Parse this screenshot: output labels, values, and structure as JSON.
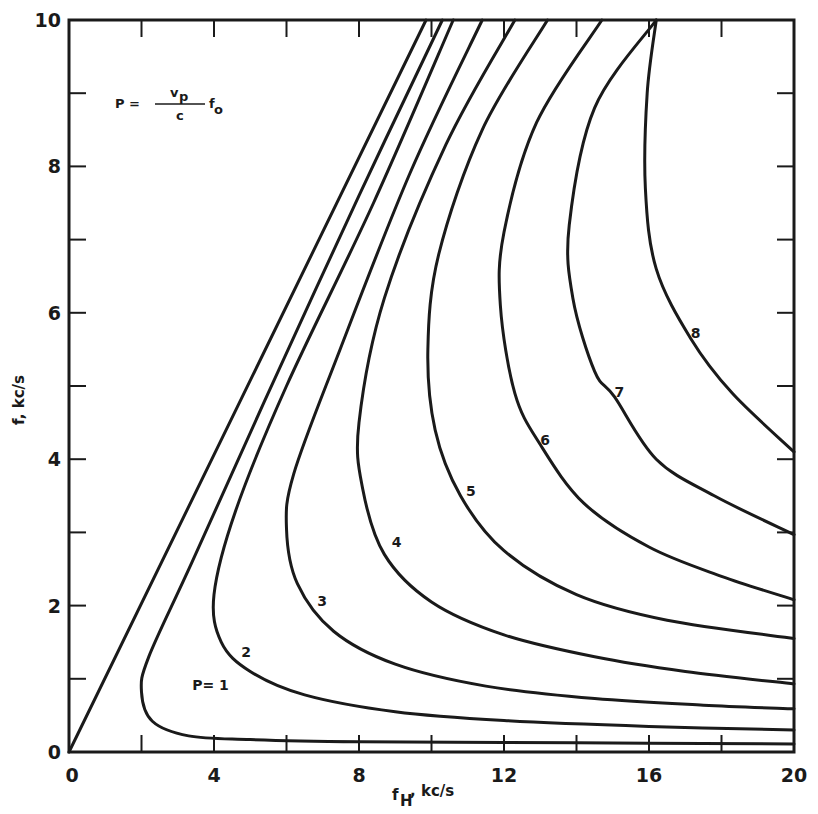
{
  "chart_data": {
    "type": "line",
    "title": "",
    "xlabel": "f_H, kc/s",
    "ylabel": "f, kc/s",
    "xlim": [
      0,
      20
    ],
    "ylim": [
      0,
      10
    ],
    "x_ticks_major": [
      0,
      4,
      8,
      12,
      16,
      20
    ],
    "x_ticks_minor_step": 2,
    "y_ticks_major": [
      0,
      2,
      4,
      6,
      8,
      10
    ],
    "y_ticks_minor_step": 1,
    "grid": false,
    "legend": null,
    "annotations": [
      {
        "text": "P = (v_p / c) f_o",
        "x": 2.3,
        "y": 9.0,
        "kind": "formula"
      },
      {
        "text": "P= 1",
        "x": 3.4,
        "y": 0.85
      },
      {
        "text": "2",
        "x": 4.75,
        "y": 1.3
      },
      {
        "text": "3",
        "x": 6.85,
        "y": 2.0
      },
      {
        "text": "4",
        "x": 8.9,
        "y": 2.8
      },
      {
        "text": "5",
        "x": 10.95,
        "y": 3.5
      },
      {
        "text": "6",
        "x": 13.0,
        "y": 4.2
      },
      {
        "text": "7",
        "x": 15.05,
        "y": 4.85
      },
      {
        "text": "8",
        "x": 17.15,
        "y": 5.65
      }
    ],
    "series": [
      {
        "name": "boundary f = f_H",
        "kind": "straight-line",
        "points": [
          [
            0,
            0
          ],
          [
            9.85,
            10
          ]
        ]
      },
      {
        "name": "P=1",
        "points": [
          [
            10.3,
            10
          ],
          [
            8.0,
            7.6
          ],
          [
            5.4,
            4.8
          ],
          [
            3.4,
            2.6
          ],
          [
            2.2,
            1.3
          ],
          [
            2.0,
            0.82
          ],
          [
            2.3,
            0.42
          ],
          [
            3.3,
            0.22
          ],
          [
            5.0,
            0.17
          ],
          [
            8.0,
            0.14
          ],
          [
            12.0,
            0.13
          ],
          [
            16.0,
            0.12
          ],
          [
            20.0,
            0.11
          ]
        ]
      },
      {
        "name": "P=2",
        "points": [
          [
            10.6,
            10
          ],
          [
            8.4,
            7.5
          ],
          [
            6.0,
            5.0
          ],
          [
            4.6,
            3.3
          ],
          [
            4.0,
            2.15
          ],
          [
            4.2,
            1.5
          ],
          [
            5.0,
            1.1
          ],
          [
            6.5,
            0.78
          ],
          [
            9.0,
            0.55
          ],
          [
            12.0,
            0.43
          ],
          [
            16.0,
            0.35
          ],
          [
            20.0,
            0.3
          ]
        ]
      },
      {
        "name": "P=3",
        "points": [
          [
            11.4,
            10
          ],
          [
            9.4,
            7.9
          ],
          [
            7.4,
            5.4
          ],
          [
            6.2,
            3.8
          ],
          [
            6.0,
            3.05
          ],
          [
            6.3,
            2.3
          ],
          [
            7.3,
            1.65
          ],
          [
            9.0,
            1.2
          ],
          [
            11.5,
            0.9
          ],
          [
            14.5,
            0.73
          ],
          [
            17.5,
            0.64
          ],
          [
            20.0,
            0.59
          ]
        ]
      },
      {
        "name": "P=4",
        "points": [
          [
            12.3,
            10
          ],
          [
            10.4,
            8.3
          ],
          [
            8.7,
            6.2
          ],
          [
            8.0,
            4.5
          ],
          [
            8.1,
            3.6
          ],
          [
            8.7,
            2.7
          ],
          [
            10.0,
            2.05
          ],
          [
            12.0,
            1.6
          ],
          [
            14.5,
            1.3
          ],
          [
            17.0,
            1.1
          ],
          [
            20.0,
            0.93
          ]
        ]
      },
      {
        "name": "P=5",
        "points": [
          [
            13.2,
            10
          ],
          [
            11.4,
            8.5
          ],
          [
            10.2,
            6.8
          ],
          [
            9.9,
            5.5
          ],
          [
            10.1,
            4.4
          ],
          [
            10.8,
            3.5
          ],
          [
            12.0,
            2.75
          ],
          [
            14.0,
            2.15
          ],
          [
            16.5,
            1.8
          ],
          [
            20.0,
            1.55
          ]
        ]
      },
      {
        "name": "P=6",
        "points": [
          [
            14.7,
            10
          ],
          [
            12.9,
            8.6
          ],
          [
            12.0,
            7.1
          ],
          [
            11.9,
            6.1
          ],
          [
            12.3,
            4.9
          ],
          [
            13.0,
            4.2
          ],
          [
            14.2,
            3.4
          ],
          [
            16.0,
            2.8
          ],
          [
            18.0,
            2.4
          ],
          [
            20.0,
            2.08
          ]
        ]
      },
      {
        "name": "P=7",
        "points": [
          [
            16.2,
            10
          ],
          [
            14.5,
            8.8
          ],
          [
            13.8,
            7.2
          ],
          [
            13.9,
            6.2
          ],
          [
            14.5,
            5.2
          ],
          [
            15.05,
            4.85
          ],
          [
            16.2,
            4.0
          ],
          [
            17.8,
            3.5
          ],
          [
            20.0,
            2.97
          ]
        ]
      },
      {
        "name": "P=8",
        "points": [
          [
            16.2,
            10
          ],
          [
            15.95,
            9.0
          ],
          [
            15.9,
            7.7
          ],
          [
            16.2,
            6.6
          ],
          [
            17.15,
            5.65
          ],
          [
            18.3,
            4.9
          ],
          [
            20.0,
            4.1
          ]
        ]
      }
    ]
  },
  "axes": {
    "x_label_main": "f",
    "x_label_sub": "H",
    "x_label_unit": ", kc/s",
    "y_label": "f, kc/s"
  },
  "formula": {
    "lhs": "P =",
    "numerator": "v",
    "numerator_sub": "p",
    "denominator": "c",
    "rhs": "f",
    "rhs_sub": "o"
  }
}
